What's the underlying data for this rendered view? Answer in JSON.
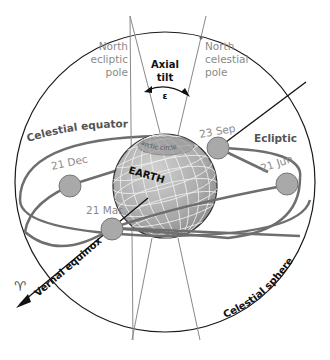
{
  "diagram": {
    "colors": {
      "sphere_outline": "#1a1a1a",
      "orbit_lines": "#6e6e6e",
      "earth_fill": "#b5b5b5",
      "earth_grid": "#eeeeee",
      "season_dot_fill": "#a9a9a9",
      "label_gray": "#8a8a8a",
      "label_dark": "#111111"
    },
    "labels": {
      "north_ecliptic_pole": [
        "North",
        "ecliptic",
        "pole"
      ],
      "north_celestial_pole": [
        "North",
        "celestial",
        "pole"
      ],
      "axial_tilt": [
        "Axial",
        "tilt"
      ],
      "epsilon": "ε",
      "celestial_equator": "Celestial equator",
      "ecliptic": "Ecliptic",
      "earth": "EARTH",
      "arctic_circle": "arctic circle",
      "vernal_equinox": "Vernal equinox",
      "aries_symbol": "♈",
      "celestial_sphere": "Celestial sphere"
    },
    "season_points": [
      {
        "label": "21 Dec"
      },
      {
        "label": "21 Mar"
      },
      {
        "label": "23 Sep"
      },
      {
        "label": "21 Jun"
      }
    ]
  }
}
